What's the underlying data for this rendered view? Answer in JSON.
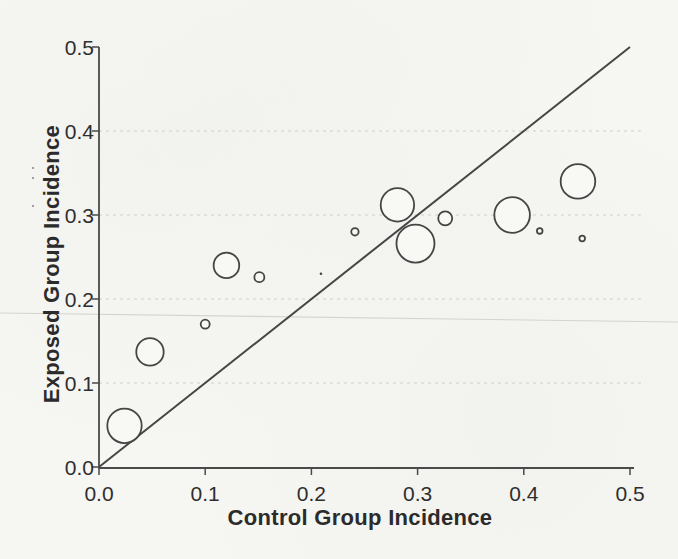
{
  "figure": {
    "kind": "scanned printed figure (L'Abbé plot)",
    "paper_color": "#f6f6f3",
    "ink_color": "#454545",
    "axis_color": "#4a4a4a",
    "grid_color": "#cfcfca",
    "artifact_color": "#d4d4cf",
    "text_color": "#2b2b2b"
  },
  "chart_data": {
    "type": "scatter",
    "subtype": "bubble",
    "title": "",
    "xlabel": "Control Group Incidence",
    "ylabel": "Exposed Group Incidence",
    "xlim": [
      0,
      0.5
    ],
    "ylim": [
      0,
      0.5
    ],
    "xtick_values": [
      0,
      0.1,
      0.2,
      0.3,
      0.4,
      0.5
    ],
    "xtick_labels": [
      "0.0",
      "0.1",
      "0.2",
      "0.3",
      "0.4",
      "0.5"
    ],
    "ytick_values": [
      0,
      0.1,
      0.2,
      0.3,
      0.4,
      0.5
    ],
    "ytick_labels": [
      "0.0",
      "0.1",
      "0.2",
      "0.3",
      "0.4",
      "0.5"
    ],
    "grid": {
      "horizontal_dashed_at": [
        0.1,
        0.2,
        0.3,
        0.4
      ],
      "vertical": false
    },
    "identity_line": {
      "x1": 0,
      "y1": 0,
      "x2": 0.5,
      "y2": 0.5
    },
    "legend": null,
    "marker_style": "open circle, area ~ study weight",
    "series": [
      {
        "name": "studies",
        "points": [
          {
            "x": 0.024,
            "y": 0.049,
            "r_px": 17.2
          },
          {
            "x": 0.048,
            "y": 0.137,
            "r_px": 13.7
          },
          {
            "x": 0.1,
            "y": 0.17,
            "r_px": 4.5
          },
          {
            "x": 0.12,
            "y": 0.24,
            "r_px": 12.8
          },
          {
            "x": 0.151,
            "y": 0.226,
            "r_px": 5.0
          },
          {
            "x": 0.209,
            "y": 0.23,
            "r_px": 1.3
          },
          {
            "x": 0.241,
            "y": 0.28,
            "r_px": 3.7
          },
          {
            "x": 0.281,
            "y": 0.312,
            "r_px": 16.7
          },
          {
            "x": 0.298,
            "y": 0.266,
            "r_px": 19.0
          },
          {
            "x": 0.326,
            "y": 0.296,
            "r_px": 7.0
          },
          {
            "x": 0.389,
            "y": 0.3,
            "r_px": 17.8
          },
          {
            "x": 0.415,
            "y": 0.281,
            "r_px": 2.8
          },
          {
            "x": 0.451,
            "y": 0.34,
            "r_px": 17.3
          },
          {
            "x": 0.455,
            "y": 0.272,
            "r_px": 2.8
          }
        ]
      }
    ]
  },
  "scan_artifacts": {
    "skew_line": {
      "x1": 0,
      "y1": 313,
      "x2": 678,
      "y2": 322
    },
    "specks": [
      [
        33,
        168
      ],
      [
        33,
        178
      ],
      [
        33,
        206
      ]
    ]
  }
}
